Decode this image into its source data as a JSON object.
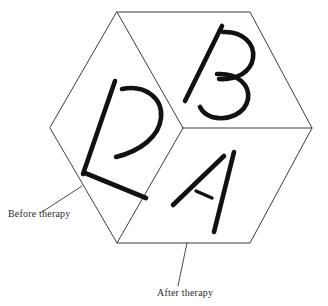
{
  "figure": {
    "background_color": "#ffffff",
    "line_color": "#3b3b42",
    "glyph_color": "#111114",
    "caption_color": "#2b2b30",
    "cube": {
      "shape": "hexagonal cube outline, three visible faces",
      "vertices": {
        "top": [
          117,
          12
        ],
        "top_right": [
          250,
          12
        ],
        "right": [
          312,
          128
        ],
        "bottom_right": [
          250,
          243
        ],
        "bottom_left": [
          117,
          243
        ],
        "left": [
          50,
          128
        ],
        "center": [
          183,
          128
        ]
      },
      "faces": [
        {
          "id": "left-face",
          "letter": "R",
          "description": "mirrored R / 2 shape on left face"
        },
        {
          "id": "top-right-face",
          "letter": "B",
          "description": "letter B on upper right face"
        },
        {
          "id": "bottom-right-face",
          "letter": "A",
          "description": "letter A on lower right face"
        }
      ]
    },
    "annotations": [
      {
        "id": "before",
        "label": "Before therapy",
        "text_x": 8,
        "text_y": 217,
        "leader_from": [
          42,
          212
        ],
        "leader_to": [
          82,
          186
        ]
      },
      {
        "id": "after",
        "label": "After therapy",
        "text_x": 157,
        "text_y": 296,
        "leader_from": [
          178,
          286
        ],
        "leader_to": [
          187,
          243
        ]
      }
    ]
  }
}
